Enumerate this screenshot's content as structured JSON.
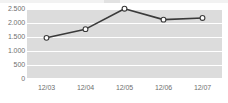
{
  "chart_data": {
    "type": "line",
    "title": "",
    "xlabel": "",
    "ylabel": "",
    "categories": [
      "12/03",
      "12/04",
      "12/05",
      "12/06",
      "12/07"
    ],
    "values": [
      1470,
      1780,
      2510,
      2120,
      2180
    ],
    "series": [
      {
        "name": "",
        "values": [
          1470,
          1780,
          2510,
          2120,
          2180
        ]
      }
    ],
    "ylim": [
      0,
      2500
    ],
    "ytick_values": [
      0,
      500,
      1000,
      1500,
      2000,
      2500
    ],
    "ytick_labels": [
      "0",
      "500",
      "1.000",
      "1.500",
      "2.000",
      "2.500"
    ],
    "xtick_labels": [
      "12/03",
      "12/04",
      "12/05",
      "12/06",
      "12/07"
    ],
    "grid": "horizontal",
    "legend": "none",
    "marker": "open-circle",
    "colors": {
      "plot_background": "#dcdcdc",
      "gridline": "#ffffff",
      "line": "#3a3a3a",
      "marker_fill": "#ffffff",
      "marker_stroke": "#3a3a3a",
      "tick_label": "#6f6f6f",
      "page_background": "#ffffff"
    }
  }
}
